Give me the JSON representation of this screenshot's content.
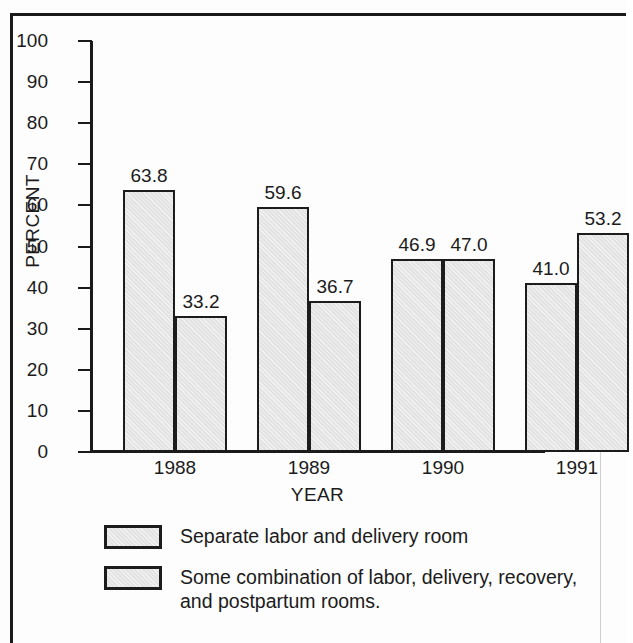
{
  "chart_data": {
    "type": "bar",
    "title": "",
    "subtitle": "",
    "xlabel": "YEAR",
    "ylabel": "PERCENT",
    "categories": [
      "1988",
      "1989",
      "1990",
      "1991"
    ],
    "series": [
      {
        "name": "Separate labor and delivery room",
        "values": [
          63.8,
          59.6,
          46.9,
          41.0
        ],
        "labels": [
          "63.8",
          "59.6",
          "46.9",
          "41.0"
        ]
      },
      {
        "name": "Some combination of labor, delivery, recovery, and postpartum rooms.",
        "values": [
          33.2,
          36.7,
          47.0,
          53.2
        ],
        "labels": [
          "33.2",
          "36.7",
          "47.0",
          "53.2"
        ]
      }
    ],
    "ylim": [
      0,
      100
    ],
    "ytick_step": 10,
    "yticks": [
      "100",
      "90",
      "80",
      "70",
      "60",
      "50",
      "40",
      "30",
      "20",
      "10",
      "0"
    ],
    "grid": false,
    "legend_position": "below",
    "bar_fill_color": "#e3e3e3",
    "bar_edge_color": "#1c1c1c",
    "axis_color": "#1a1a1a",
    "text_color": "#1b1b1b",
    "background_color": "#fdfdfd"
  },
  "legend": {
    "items": [
      {
        "label": "Separate labor and delivery room"
      },
      {
        "label": "Some combination of labor, delivery, recovery, and postpartum rooms."
      }
    ]
  }
}
